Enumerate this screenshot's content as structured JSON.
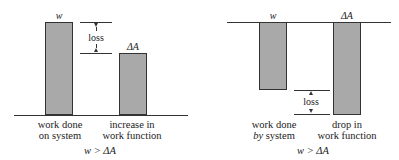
{
  "left_panel": {
    "bar1": {
      "top_label": "w",
      "caption_line1": "work done",
      "caption_line2": "on system"
    },
    "bar2": {
      "top_label": "ΔA",
      "caption_line1": "increase in",
      "caption_line2": "work function"
    },
    "loss_label": "loss",
    "relation": "w > ΔA"
  },
  "right_panel": {
    "bar1": {
      "top_label": "w",
      "caption_line1": "work done",
      "caption_line2_italic": "by",
      "caption_line2_rest": " system"
    },
    "bar2": {
      "top_label": "ΔA",
      "caption_line1": "drop in",
      "caption_line2": "work function"
    },
    "loss_label": "loss",
    "relation": "w > ΔA"
  },
  "colors": {
    "bar_fill": "#a9a9a9",
    "line": "#333333"
  }
}
